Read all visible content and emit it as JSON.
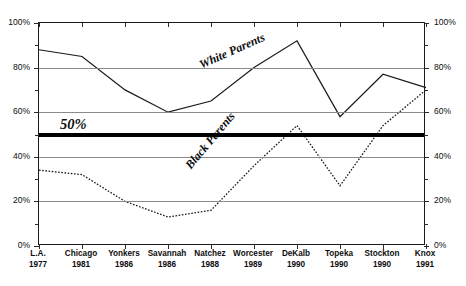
{
  "chart_data": {
    "type": "line",
    "title": "",
    "subtitle": "",
    "xlabel": "",
    "ylabel": "",
    "ylim": [
      0,
      100
    ],
    "yticks": [
      0,
      20,
      40,
      60,
      80,
      100
    ],
    "ytick_labels": [
      "0%",
      "20%",
      "40%",
      "60%",
      "80%",
      "100%"
    ],
    "grid": true,
    "legend_position": "inline-annotations",
    "axis_right_labels": [
      "0%",
      "20%",
      "40%",
      "60%",
      "80%",
      "100%"
    ],
    "categories": [
      "L.A.",
      "Chicago",
      "Yonkers",
      "Savannah",
      "Natchez",
      "Worcester",
      "DeKalb",
      "Topeka",
      "Stockton",
      "Knox"
    ],
    "category_years": [
      "1977",
      "1981",
      "1986",
      "1986",
      "1988",
      "1989",
      "1990",
      "1990",
      "1990",
      "1991"
    ],
    "series": [
      {
        "name": "White Parents",
        "style": "solid",
        "color": "#1a1a1a",
        "values": [
          88,
          85,
          70,
          60,
          65,
          80,
          92,
          58,
          77,
          71
        ]
      },
      {
        "name": "Black Parents",
        "style": "dotted",
        "color": "#1a1a1a",
        "values": [
          34,
          32,
          20,
          13,
          16,
          36,
          54,
          27,
          54,
          70
        ]
      }
    ],
    "annotations": [
      {
        "text": "50%",
        "value": 50,
        "kind": "threshold-line",
        "line_color": "#000000"
      },
      {
        "text": "White Parents",
        "kind": "series-label",
        "series": "White Parents"
      },
      {
        "text": "Black Parents",
        "kind": "series-label",
        "series": "Black Parents"
      }
    ]
  }
}
